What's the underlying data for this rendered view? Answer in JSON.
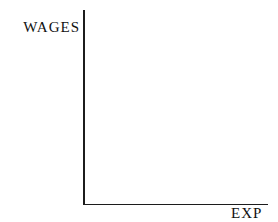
{
  "chart_data": {
    "type": "line",
    "title": "",
    "ylabel": "WAGES",
    "xlabel": "EXP",
    "series": [],
    "x_ticks": [],
    "y_ticks": [],
    "grid": false,
    "legend": false,
    "colors": {
      "axis": "#1c1c1c",
      "text": "#111111",
      "background": "#ffffff"
    }
  }
}
